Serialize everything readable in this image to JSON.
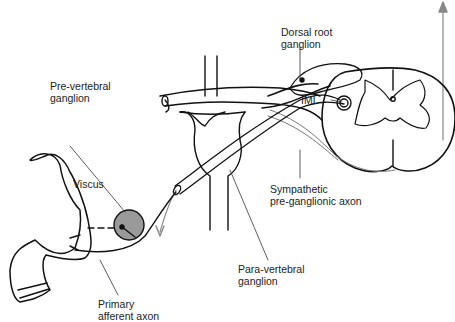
{
  "diagram": {
    "type": "anatomical schematic",
    "colors": {
      "line": "#111111",
      "ganglion_fill": "#9a9a9a",
      "pathway_gray": "#888888"
    },
    "labels": {
      "dorsal_root_ganglion": [
        "Dorsal root",
        "ganglion"
      ],
      "pre_vertebral_ganglion": [
        "Pre-vertebral",
        "ganglion"
      ],
      "iml": "IML",
      "viscus": "Viscus",
      "sympathetic_axon": [
        "Sympathetic",
        "pre-ganglionic axon"
      ],
      "para_vertebral_ganglion": [
        "Para-vertebral",
        "ganglion"
      ],
      "primary_afferent_axon": [
        "Primary",
        "afferent axon"
      ]
    }
  }
}
